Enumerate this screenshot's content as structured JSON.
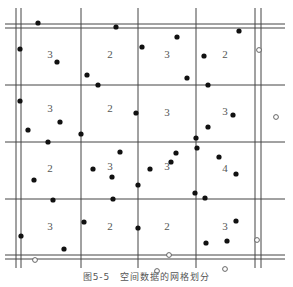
{
  "figure": {
    "caption": "图5-5　空间数据的网格划分",
    "colors": {
      "line": "#444444",
      "point": "#111111",
      "label": "#555555",
      "hollow_stroke": "#555555"
    },
    "grid": {
      "vertical_lines": [
        16,
        21,
        81,
        138,
        196,
        255,
        261
      ],
      "horizontal_lines": [
        24,
        28,
        85,
        142,
        199,
        255,
        259
      ],
      "x_extent": [
        5,
        285
      ],
      "y_extent": [
        8,
        268
      ]
    },
    "cell_counts": [
      {
        "x": 50,
        "y": 58,
        "label": "3"
      },
      {
        "x": 110,
        "y": 58,
        "label": "2"
      },
      {
        "x": 167,
        "y": 58,
        "label": "3"
      },
      {
        "x": 225,
        "y": 58,
        "label": "2"
      },
      {
        "x": 50,
        "y": 112,
        "label": "3"
      },
      {
        "x": 110,
        "y": 112,
        "label": "2"
      },
      {
        "x": 167,
        "y": 116,
        "label": "3"
      },
      {
        "x": 225,
        "y": 115,
        "label": "3"
      },
      {
        "x": 50,
        "y": 172,
        "label": "2"
      },
      {
        "x": 110,
        "y": 170,
        "label": "3"
      },
      {
        "x": 167,
        "y": 170,
        "label": "3"
      },
      {
        "x": 225,
        "y": 172,
        "label": "4"
      },
      {
        "x": 50,
        "y": 230,
        "label": "3"
      },
      {
        "x": 110,
        "y": 230,
        "label": "2"
      },
      {
        "x": 167,
        "y": 230,
        "label": "2"
      },
      {
        "x": 225,
        "y": 230,
        "label": "3"
      }
    ],
    "points": [
      [
        38,
        23
      ],
      [
        116,
        27
      ],
      [
        20,
        49
      ],
      [
        57,
        62
      ],
      [
        87,
        75
      ],
      [
        98,
        85
      ],
      [
        177,
        37
      ],
      [
        142,
        47
      ],
      [
        204,
        56
      ],
      [
        239,
        31
      ],
      [
        187,
        78
      ],
      [
        208,
        85
      ],
      [
        20,
        101
      ],
      [
        60,
        122
      ],
      [
        28,
        130
      ],
      [
        48,
        142
      ],
      [
        81,
        134
      ],
      [
        136,
        113
      ],
      [
        196,
        138
      ],
      [
        176,
        153
      ],
      [
        233,
        115
      ],
      [
        208,
        127
      ],
      [
        120,
        152
      ],
      [
        93,
        169
      ],
      [
        112,
        177
      ],
      [
        138,
        185
      ],
      [
        113,
        199
      ],
      [
        150,
        169
      ],
      [
        171,
        162
      ],
      [
        197,
        148
      ],
      [
        219,
        157
      ],
      [
        236,
        174
      ],
      [
        34,
        180
      ],
      [
        53,
        200
      ],
      [
        195,
        193
      ],
      [
        205,
        198
      ],
      [
        84,
        222
      ],
      [
        138,
        228
      ],
      [
        21,
        236
      ],
      [
        64,
        249
      ],
      [
        236,
        221
      ],
      [
        227,
        241
      ],
      [
        206,
        243
      ]
    ],
    "hollow_points": [
      [
        259,
        50
      ],
      [
        276,
        117
      ],
      [
        35,
        260
      ],
      [
        169,
        255
      ],
      [
        257,
        240
      ],
      [
        157,
        271
      ],
      [
        225,
        269
      ]
    ]
  }
}
